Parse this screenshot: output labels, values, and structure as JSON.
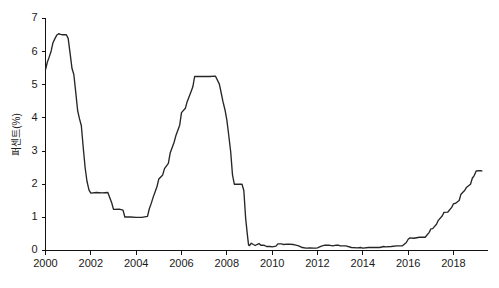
{
  "chart_data": {
    "type": "line",
    "title": "",
    "subtitle": "",
    "xlabel": "",
    "ylabel": "퍼센트(%)",
    "xlim": [
      2000,
      2019.5
    ],
    "ylim": [
      0,
      7
    ],
    "grid": false,
    "legend": null,
    "legend_position": "none",
    "line_color": "#262626",
    "background_color": "#ffffff",
    "axis_color": "#111111",
    "xticks": [
      2000,
      2002,
      2004,
      2006,
      2008,
      2010,
      2012,
      2014,
      2016,
      2018
    ],
    "xtick_labels": [
      "2000",
      "2002",
      "2004",
      "2006",
      "2008",
      "2010",
      "2012",
      "2014",
      "2016",
      "2018"
    ],
    "yticks": [
      0,
      1,
      2,
      3,
      4,
      5,
      6,
      7
    ],
    "ytick_labels": [
      "0",
      "1",
      "2",
      "3",
      "4",
      "5",
      "6",
      "7"
    ],
    "series": [
      {
        "name": "정책금리",
        "x": [
          2000.0,
          2000.08,
          2000.17,
          2000.25,
          2000.33,
          2000.42,
          2000.5,
          2000.58,
          2000.67,
          2000.75,
          2000.83,
          2000.92,
          2001.0,
          2001.08,
          2001.17,
          2001.25,
          2001.33,
          2001.42,
          2001.5,
          2001.58,
          2001.67,
          2001.75,
          2001.83,
          2001.92,
          2002.0,
          2002.25,
          2002.5,
          2002.75,
          2002.92,
          2003.0,
          2003.25,
          2003.42,
          2003.5,
          2003.75,
          2004.0,
          2004.25,
          2004.5,
          2004.58,
          2004.67,
          2004.75,
          2004.83,
          2004.92,
          2005.0,
          2005.17,
          2005.25,
          2005.42,
          2005.5,
          2005.67,
          2005.75,
          2005.92,
          2006.0,
          2006.17,
          2006.25,
          2006.42,
          2006.5,
          2006.58,
          2006.67,
          2006.75,
          2006.92,
          2007.0,
          2007.25,
          2007.5,
          2007.67,
          2007.75,
          2007.83,
          2007.92,
          2008.0,
          2008.08,
          2008.17,
          2008.25,
          2008.33,
          2008.5,
          2008.67,
          2008.75,
          2008.83,
          2008.92,
          2008.96,
          2009.0,
          2009.08,
          2009.17,
          2009.25,
          2009.33,
          2009.42,
          2009.5,
          2009.58,
          2009.67,
          2009.75,
          2009.83,
          2009.92,
          2010.0,
          2010.17,
          2010.25,
          2010.42,
          2010.5,
          2010.67,
          2010.75,
          2010.92,
          2011.0,
          2011.17,
          2011.33,
          2011.5,
          2011.67,
          2011.83,
          2011.92,
          2012.0,
          2012.17,
          2012.33,
          2012.5,
          2012.67,
          2012.83,
          2012.92,
          2013.0,
          2013.25,
          2013.5,
          2013.75,
          2013.92,
          2014.0,
          2014.25,
          2014.5,
          2014.75,
          2014.92,
          2015.0,
          2015.25,
          2015.5,
          2015.75,
          2015.92,
          2016.0,
          2016.08,
          2016.25,
          2016.5,
          2016.75,
          2016.92,
          2017.0,
          2017.08,
          2017.25,
          2017.33,
          2017.5,
          2017.58,
          2017.75,
          2017.92,
          2018.0,
          2018.08,
          2018.25,
          2018.33,
          2018.5,
          2018.58,
          2018.75,
          2018.83,
          2018.92,
          2019.0,
          2019.17,
          2019.25
        ],
        "y": [
          5.45,
          5.68,
          5.85,
          6.02,
          6.27,
          6.4,
          6.5,
          6.54,
          6.52,
          6.51,
          6.51,
          6.51,
          6.4,
          5.98,
          5.49,
          5.31,
          4.8,
          4.21,
          3.97,
          3.77,
          3.07,
          2.49,
          2.09,
          1.82,
          1.73,
          1.75,
          1.74,
          1.75,
          1.44,
          1.24,
          1.25,
          1.22,
          1.01,
          1.01,
          1.0,
          1.0,
          1.03,
          1.26,
          1.43,
          1.61,
          1.76,
          1.93,
          2.16,
          2.28,
          2.47,
          2.63,
          2.94,
          3.26,
          3.46,
          3.78,
          4.16,
          4.29,
          4.49,
          4.79,
          4.94,
          5.25,
          5.25,
          5.25,
          5.25,
          5.25,
          5.25,
          5.26,
          5.02,
          4.76,
          4.49,
          4.24,
          3.94,
          3.5,
          2.98,
          2.28,
          2.0,
          2.0,
          2.0,
          1.81,
          0.97,
          0.39,
          0.16,
          0.15,
          0.22,
          0.18,
          0.15,
          0.18,
          0.21,
          0.16,
          0.16,
          0.15,
          0.12,
          0.12,
          0.12,
          0.11,
          0.13,
          0.2,
          0.2,
          0.18,
          0.19,
          0.19,
          0.18,
          0.17,
          0.14,
          0.09,
          0.07,
          0.08,
          0.07,
          0.07,
          0.08,
          0.13,
          0.16,
          0.16,
          0.14,
          0.16,
          0.16,
          0.14,
          0.14,
          0.09,
          0.08,
          0.09,
          0.07,
          0.09,
          0.09,
          0.09,
          0.12,
          0.11,
          0.12,
          0.14,
          0.14,
          0.24,
          0.34,
          0.38,
          0.37,
          0.4,
          0.4,
          0.54,
          0.65,
          0.66,
          0.79,
          0.91,
          1.04,
          1.15,
          1.16,
          1.3,
          1.41,
          1.42,
          1.51,
          1.7,
          1.82,
          1.91,
          2.0,
          2.18,
          2.27,
          2.4,
          2.41,
          2.4
        ]
      }
    ],
    "annotations": []
  }
}
